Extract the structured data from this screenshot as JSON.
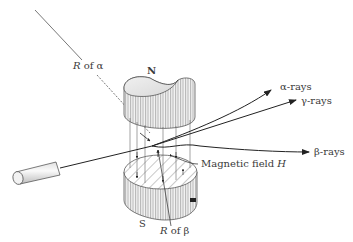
{
  "diagram": {
    "labels": {
      "north_pole": "N",
      "south_pole": "S",
      "radius_alpha_R": "R",
      "radius_alpha_of": "of α",
      "radius_beta_R": "R",
      "radius_beta_of": "of β",
      "magnetic_field": "Magnetic field",
      "magnetic_field_symbol": "H",
      "alpha_rays": "α-rays",
      "gamma_rays": "γ-rays",
      "beta_rays": "β-rays"
    },
    "colors": {
      "line": "#222222",
      "text": "#3a3a3a",
      "hatch": "#888888",
      "background": "#ffffff"
    }
  }
}
